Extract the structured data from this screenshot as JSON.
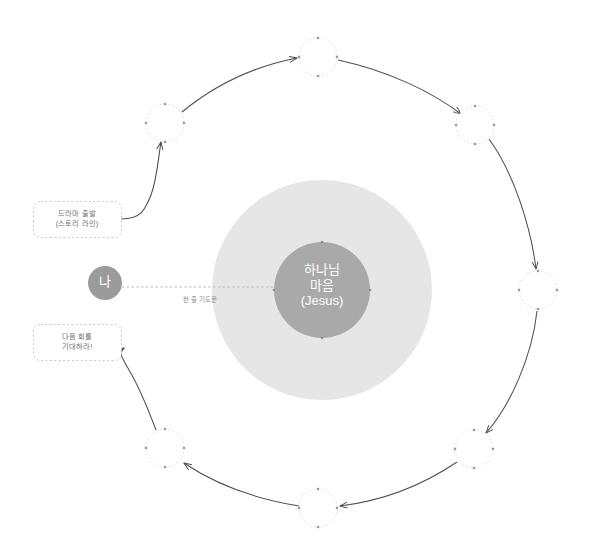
{
  "diagram": {
    "background_color": "#ffffff",
    "center": {
      "label_line1": "하나님",
      "label_line2": "마음",
      "label_line3": "(Jesus)",
      "fill_color": "#a9a9a9",
      "text_color": "#ffffff",
      "cx": 322,
      "cy": 290,
      "r": 48
    },
    "halo": {
      "fill_color": "#e6e6e6",
      "cx": 322,
      "cy": 290,
      "r": 110
    },
    "self_node": {
      "label": "나",
      "fill_color": "#9b9b9b",
      "text_color": "#ffffff",
      "cx": 105,
      "cy": 283,
      "r": 17
    },
    "connector": {
      "label": "한 줄 기도문",
      "style": "dotted",
      "color": "#b4b4b4",
      "from_x": 122,
      "to_x": 274,
      "y": 287
    },
    "orbit": {
      "cx": 322,
      "cy": 290,
      "r": 218,
      "node_r": 19,
      "node_fill": "#ffffff",
      "node_stroke": "#d8d8d8",
      "dot_color": "#9a9a9a",
      "arrow_color": "#4d4d4d",
      "nodes": [
        {
          "name": "orbit-node-1",
          "cx": 165,
          "cy": 123
        },
        {
          "name": "orbit-node-2",
          "cx": 318,
          "cy": 57
        },
        {
          "name": "orbit-node-3",
          "cx": 475,
          "cy": 125
        },
        {
          "name": "orbit-node-4",
          "cx": 538,
          "cy": 290
        },
        {
          "name": "orbit-node-5",
          "cx": 474,
          "cy": 449
        },
        {
          "name": "orbit-node-6",
          "cx": 318,
          "cy": 508
        },
        {
          "name": "orbit-node-7",
          "cx": 165,
          "cy": 448
        },
        {
          "name": "orbit-node-8",
          "cx": 105,
          "cy": 283
        }
      ]
    },
    "callouts": [
      {
        "name": "callout-start",
        "line1": "드라마 출발",
        "line2": "(스토리 라인)",
        "x": 33,
        "y": 201,
        "width": 88,
        "height": 36,
        "stroke_color": "#c9c9c9",
        "fill_color": "#ffffff"
      },
      {
        "name": "callout-next",
        "line1": "다음 회를",
        "line2": "기대하라!",
        "x": 33,
        "y": 324,
        "width": 88,
        "height": 36,
        "stroke_color": "#c9c9c9",
        "fill_color": "#ffffff"
      }
    ]
  }
}
